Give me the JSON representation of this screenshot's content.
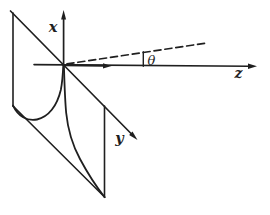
{
  "figure": {
    "background_color": "#ffffff",
    "ink_color": "#1f1f1f",
    "labels": {
      "x_axis": "x",
      "y_axis": "y",
      "z_axis": "z",
      "angle": "θ"
    }
  }
}
